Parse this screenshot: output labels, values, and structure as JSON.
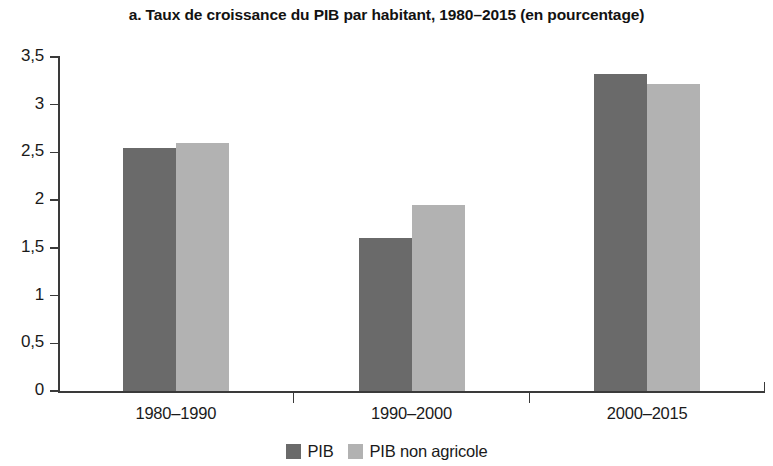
{
  "chart_data": {
    "type": "bar",
    "title": "a. Taux de croissance du PIB par habitant, 1980–2015 (en pourcentage)",
    "xlabel": "",
    "ylabel": "",
    "categories": [
      "1980–1990",
      "1990–2000",
      "2000–2015"
    ],
    "series": [
      {
        "name": "PIB",
        "values": [
          2.55,
          1.6,
          3.32
        ],
        "color": "#6a6a6a"
      },
      {
        "name": "PIB non agricole",
        "values": [
          2.6,
          1.95,
          3.22
        ],
        "color": "#b2b2b2"
      }
    ],
    "ylim": [
      0,
      3.5
    ],
    "yticks": [
      0,
      0.5,
      1,
      1.5,
      2,
      2.5,
      3,
      3.5
    ],
    "ytick_labels": [
      "0",
      "0,5",
      "1",
      "1,5",
      "2",
      "2,5",
      "3",
      "3,5"
    ],
    "grid": false,
    "legend_position": "bottom"
  },
  "legend": {
    "entries": [
      {
        "label": "PIB"
      },
      {
        "label": "PIB non agricole"
      }
    ]
  }
}
